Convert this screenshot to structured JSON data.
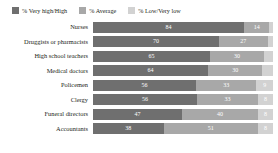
{
  "legend": {
    "position": "top-left",
    "items": [
      {
        "label": "% Very high/High",
        "color": "#6f6f6f",
        "icon": "legend-swatch-icon"
      },
      {
        "label": "% Average",
        "color": "#a8a8a8",
        "icon": "legend-swatch-icon"
      },
      {
        "label": "% Low/Very low",
        "color": "#d2d2d2",
        "icon": "legend-swatch-icon"
      }
    ]
  },
  "chart_data": {
    "type": "bar",
    "subtype": "stacked-horizontal-bar",
    "title": "",
    "subtitle": "",
    "xlabel": "",
    "ylabel": "",
    "xlim": [
      0,
      100
    ],
    "grid": false,
    "legend_position": "top-left",
    "categories": [
      "Nurses",
      "Druggists or pharmacists",
      "High school teachers",
      "Medical doctors",
      "Policemen",
      "Clergy",
      "Funeral directors",
      "Accountants"
    ],
    "series": [
      {
        "name": "% Very high/High",
        "color": "#6f6f6f",
        "values": [
          84,
          70,
          65,
          64,
          56,
          56,
          47,
          38
        ]
      },
      {
        "name": "% Average",
        "color": "#a8a8a8",
        "values": [
          14,
          27,
          30,
          30,
          33,
          33,
          40,
          51
        ]
      },
      {
        "name": "% Low/Very low",
        "color": "#d2d2d2",
        "values": [
          2,
          3,
          5,
          6,
          9,
          8,
          8,
          8
        ]
      }
    ],
    "rows": [
      {
        "category": "Nurses",
        "very_high_high": 84,
        "average": 14,
        "low_very_low": 2,
        "labels": {
          "very_high_high": "84",
          "average": "14",
          "low_very_low": ""
        }
      },
      {
        "category": "Druggists or pharmacists",
        "very_high_high": 70,
        "average": 27,
        "low_very_low": 3,
        "labels": {
          "very_high_high": "70",
          "average": "27",
          "low_very_low": ""
        }
      },
      {
        "category": "High school teachers",
        "very_high_high": 65,
        "average": 30,
        "low_very_low": 5,
        "labels": {
          "very_high_high": "65",
          "average": "30",
          "low_very_low": ""
        }
      },
      {
        "category": "Medical doctors",
        "very_high_high": 64,
        "average": 30,
        "low_very_low": 6,
        "labels": {
          "very_high_high": "64",
          "average": "30",
          "low_very_low": ""
        }
      },
      {
        "category": "Policemen",
        "very_high_high": 56,
        "average": 33,
        "low_very_low": 9,
        "labels": {
          "very_high_high": "56",
          "average": "33",
          "low_very_low": "9"
        }
      },
      {
        "category": "Clergy",
        "very_high_high": 56,
        "average": 33,
        "low_very_low": 8,
        "labels": {
          "very_high_high": "56",
          "average": "33",
          "low_very_low": "8"
        }
      },
      {
        "category": "Funeral directors",
        "very_high_high": 47,
        "average": 40,
        "low_very_low": 8,
        "labels": {
          "very_high_high": "47",
          "average": "40",
          "low_very_low": "8"
        }
      },
      {
        "category": "Accountants",
        "very_high_high": 38,
        "average": 51,
        "low_very_low": 8,
        "labels": {
          "very_high_high": "38",
          "average": "51",
          "low_very_low": "8"
        }
      }
    ]
  }
}
